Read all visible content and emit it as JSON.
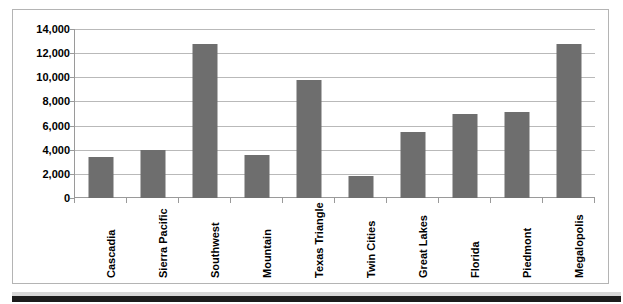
{
  "chart_data": {
    "type": "bar",
    "title": "",
    "subtitle": "",
    "xlabel": "",
    "ylabel": "",
    "ylim": [
      0,
      14000
    ],
    "ytick_step": 2000,
    "grid": true,
    "legend": false,
    "legend_position": "none",
    "bar_color": "#6e6e6e",
    "categories": [
      "Cascadia",
      "Sierra Pacific",
      "Southwest",
      "Mountain",
      "Texas Triangle",
      "Twin Cities",
      "Great Lakes",
      "Florida",
      "Piedmont",
      "Megalopolis"
    ],
    "values": [
      3400,
      4000,
      12800,
      3550,
      9800,
      1800,
      5450,
      6950,
      7100,
      12750
    ],
    "ytick_labels": [
      "0",
      "2,000",
      "4,000",
      "6,000",
      "8,000",
      "10,000",
      "12,000",
      "14,000"
    ],
    "ytick_values": [
      0,
      2000,
      4000,
      6000,
      8000,
      10000,
      12000,
      14000
    ]
  }
}
